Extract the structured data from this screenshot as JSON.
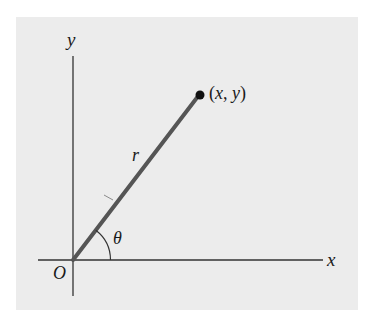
{
  "diagram": {
    "axes": {
      "x_label": "x",
      "y_label": "y",
      "origin_label": "O"
    },
    "radius_label": "r",
    "angle_label": "θ",
    "point": {
      "open_paren": "(",
      "x": "x",
      "comma": ", ",
      "y": "y",
      "close_paren": ")"
    },
    "colors": {
      "page_background": "#ffffff",
      "panel_background": "#ececec",
      "axis_stroke": "#333333",
      "radius_stroke": "#555555",
      "point_fill": "#111111",
      "text": "#1a1a1a"
    }
  }
}
